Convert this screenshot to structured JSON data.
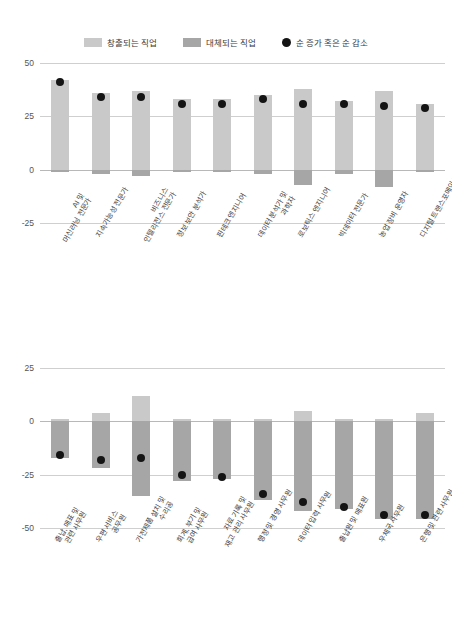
{
  "legend": {
    "items": [
      {
        "label": "창출되는 직업",
        "type": "swatch",
        "color": "#c9c9c9",
        "icon": "square-swatch-icon"
      },
      {
        "label": "대체되는 직업",
        "type": "swatch",
        "color": "#a6a6a6",
        "icon": "square-swatch-icon"
      },
      {
        "label": "순 증가 혹은 순 감소",
        "type": "dot",
        "color": "#141414",
        "icon": "circle-marker-icon"
      }
    ]
  },
  "colors": {
    "created": "#c9c9c9",
    "displaced": "#a6a6a6",
    "net": "#141414",
    "grid": "#cfcfcf",
    "zero_line": "#b8b8b8"
  },
  "chart_data": [
    {
      "type": "bar",
      "title": "",
      "xlabel": "",
      "ylabel": "",
      "ylim": [
        -25,
        50
      ],
      "yticks": [
        50,
        25,
        0,
        -25
      ],
      "ytick_labels": [
        "50",
        "25",
        "0",
        "-25"
      ],
      "grid": true,
      "legend_position": "top-center",
      "categories": [
        "AI 및\n머신러닝 전문가",
        "지속가능성 전문가",
        "비즈니스\n인텔리전스 전문가",
        "정보 보안 분석가",
        "핀테크 엔지니어",
        "데이터 분석가 및\n과학자",
        "로보틱스 엔지니어",
        "빅데이터 전문가",
        "농업 장비 운영자",
        "디지털 트랜스포메이션\n전문가"
      ],
      "series": [
        {
          "name": "창출되는 직업",
          "values": [
            42,
            36,
            37,
            33,
            33,
            35,
            38,
            32,
            37,
            31
          ]
        },
        {
          "name": "대체되는 직업",
          "values": [
            -1,
            -2,
            -3,
            -1,
            -1,
            -2,
            -7,
            -2,
            -8,
            -1
          ]
        },
        {
          "name": "순 증가 혹은 순 감소",
          "type": "scatter",
          "values": [
            41,
            34,
            34,
            31,
            31,
            33,
            31,
            31,
            30,
            29
          ]
        }
      ]
    },
    {
      "type": "bar",
      "title": "",
      "xlabel": "",
      "ylabel": "",
      "ylim": [
        -50,
        25
      ],
      "yticks": [
        25,
        0,
        -25,
        -50
      ],
      "ytick_labels": [
        "25",
        "0",
        "-25",
        "-50"
      ],
      "grid": true,
      "legend_position": "top-center",
      "categories": [
        "출납, 매표 및\n관련 사무원",
        "우편 서비스\n공무원",
        "가전제품 설치 및\n수리공",
        "회계, 부기 및\n급여 사무원",
        "자료 기록 및\n재고 관리 사무원",
        "행정 및 경영 사무원",
        "데이터 입력 사무원",
        "출납원 및 매표원",
        "우체국 사무원",
        "은행 및 관련 사무원"
      ],
      "series": [
        {
          "name": "창출되는 직업",
          "values": [
            1,
            4,
            12,
            1,
            1,
            1,
            5,
            1,
            1,
            4
          ]
        },
        {
          "name": "대체되는 직업",
          "values": [
            -17,
            -22,
            -35,
            -28,
            -27,
            -37,
            -42,
            -41,
            -46,
            -46
          ]
        },
        {
          "name": "순 증가 혹은 순 감소",
          "type": "scatter",
          "values": [
            -16,
            -18,
            -17,
            -25,
            -26,
            -34,
            -38,
            -40,
            -44,
            -44
          ]
        }
      ]
    }
  ]
}
